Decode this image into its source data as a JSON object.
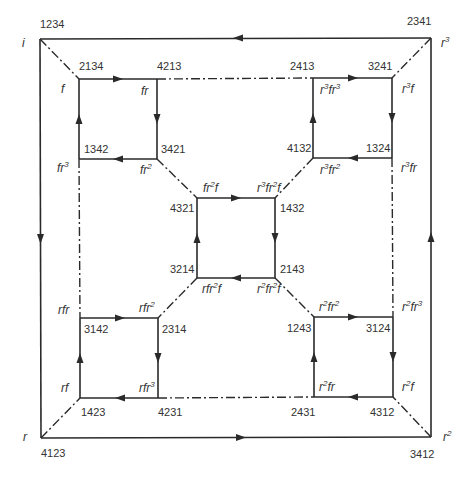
{
  "diagram": {
    "kind": "Cayley graph of symmetric group S4 (nested squares)",
    "colors": {
      "line": "#2a2a2a",
      "text": "#333333",
      "background": "#ffffff"
    },
    "legend": {
      "solid_edge": "r (directed, arrowed)",
      "dashdot_edge": "f (undirected)"
    },
    "vertices": [
      {
        "id": "v_i",
        "perm": "1234",
        "elem": "i",
        "x": 40,
        "y": 39
      },
      {
        "id": "v_r3",
        "perm": "2341",
        "elem": "r^3",
        "x": 431,
        "y": 38
      },
      {
        "id": "v_r2",
        "perm": "3412",
        "elem": "r^2",
        "x": 431,
        "y": 437
      },
      {
        "id": "v_r",
        "perm": "4123",
        "elem": "r",
        "x": 41,
        "y": 438
      },
      {
        "id": "v_f",
        "perm": "2134",
        "elem": "f",
        "x": 79,
        "y": 79
      },
      {
        "id": "v_fr",
        "perm": "4213",
        "elem": "fr",
        "x": 157,
        "y": 79
      },
      {
        "id": "v_fr2",
        "perm": "3421",
        "elem": "fr^2",
        "x": 157,
        "y": 159
      },
      {
        "id": "v_fr3",
        "perm": "1342",
        "elem": "fr^3",
        "x": 79,
        "y": 159
      },
      {
        "id": "v_r3fr3",
        "perm": "2413",
        "elem": "r^3fr^3",
        "x": 313,
        "y": 78
      },
      {
        "id": "v_r3f",
        "perm": "3241",
        "elem": "r^3f",
        "x": 392,
        "y": 78
      },
      {
        "id": "v_r3fr",
        "perm": "1324",
        "elem": "r^3fr",
        "x": 392,
        "y": 158
      },
      {
        "id": "v_r3fr2",
        "perm": "4132",
        "elem": "r^3fr^2",
        "x": 313,
        "y": 158
      },
      {
        "id": "v_fr2f",
        "perm": "4321",
        "elem": "fr^2f",
        "x": 197,
        "y": 198
      },
      {
        "id": "v_r3fr2f",
        "perm": "1432",
        "elem": "r^3fr^2f",
        "x": 275,
        "y": 198
      },
      {
        "id": "v_r2fr2f",
        "perm": "2143",
        "elem": "r^2fr^2f",
        "x": 275,
        "y": 278
      },
      {
        "id": "v_rfr2f",
        "perm": "3214",
        "elem": "rfr^2f",
        "x": 197,
        "y": 278
      },
      {
        "id": "v_rfr",
        "perm": "3142",
        "elem": "rfr",
        "x": 80,
        "y": 318
      },
      {
        "id": "v_rfr2",
        "perm": "2314",
        "elem": "rfr^2",
        "x": 158,
        "y": 318
      },
      {
        "id": "v_rfr3",
        "perm": "4231",
        "elem": "rfr^3",
        "x": 158,
        "y": 398
      },
      {
        "id": "v_rf",
        "perm": "1423",
        "elem": "rf",
        "x": 80,
        "y": 398
      },
      {
        "id": "v_r2fr2",
        "perm": "1243",
        "elem": "r^2fr^2",
        "x": 314,
        "y": 317
      },
      {
        "id": "v_r2fr3",
        "perm": "3124",
        "elem": "r^2fr^3",
        "x": 393,
        "y": 317
      },
      {
        "id": "v_r2f",
        "perm": "4312",
        "elem": "r^2f",
        "x": 393,
        "y": 397
      },
      {
        "id": "v_r2fr",
        "perm": "2431",
        "elem": "r^2fr",
        "x": 314,
        "y": 397
      }
    ],
    "labels": {
      "outer": {
        "tl_num": "1234",
        "tl_elem": "i",
        "tr_num": "2341",
        "tr_elem": "r",
        "tr_sup": "3",
        "br_num": "3412",
        "br_elem": "r",
        "br_sup": "2",
        "bl_num": "4123",
        "bl_elem": "r"
      },
      "sq_tl": {
        "a_num": "2134",
        "a_elem": "f",
        "b_num": "4213",
        "b_elem": "fr",
        "c_num": "3421",
        "c_elem": "fr",
        "c_sup": "2",
        "d_num": "1342",
        "d_elem": "fr",
        "d_sup": "3"
      },
      "sq_tr": {
        "a_num": "2413",
        "a_e1": "r",
        "a_s1": "3",
        "a_e2": "fr",
        "a_s2": "3",
        "b_num": "3241",
        "b_e1": "r",
        "b_s1": "3",
        "b_e2": "f",
        "c_num": "1324",
        "c_e1": "r",
        "c_s1": "3",
        "c_e2": "fr",
        "d_num": "4132",
        "d_e1": "r",
        "d_s1": "3",
        "d_e2": "fr",
        "d_s2": "2"
      },
      "sq_c": {
        "a_num": "4321",
        "a_e1": "fr",
        "a_s1": "2",
        "a_e2": "f",
        "b_num": "1432",
        "b_e1": "r",
        "b_s1": "3",
        "b_e2": "fr",
        "b_s2": "2",
        "b_e3": "f",
        "c_num": "2143",
        "c_e1": "r",
        "c_s1": "2",
        "c_e2": "fr",
        "c_s2": "2",
        "c_e3": "f",
        "d_num": "3214",
        "d_e1": "rfr",
        "d_s1": "2",
        "d_e2": "f"
      },
      "sq_bl": {
        "a_num": "3142",
        "a_elem": "rfr",
        "b_num": "2314",
        "b_elem": "rfr",
        "b_sup": "2",
        "c_num": "4231",
        "c_elem": "rfr",
        "c_sup": "3",
        "d_num": "1423",
        "d_elem": "rf"
      },
      "sq_br": {
        "a_num": "1243",
        "a_e1": "r",
        "a_s1": "2",
        "a_e2": "fr",
        "a_s2": "2",
        "b_num": "3124",
        "b_e1": "r",
        "b_s1": "2",
        "b_e2": "fr",
        "b_s2": "3",
        "c_num": "4312",
        "c_e1": "r",
        "c_s1": "2",
        "c_e2": "f",
        "d_num": "2431",
        "d_e1": "r",
        "d_s1": "2",
        "d_e2": "fr"
      }
    }
  }
}
